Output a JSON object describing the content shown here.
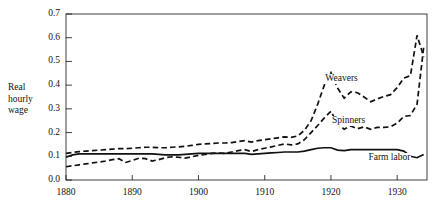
{
  "chart_data": {
    "type": "line",
    "title": "",
    "subtitle": "",
    "xlabel": "",
    "ylabel": "Real hourly wage",
    "ylabel_lines": [
      "Real",
      "hourly",
      "wage"
    ],
    "xlim": [
      1880,
      1934.5
    ],
    "ylim": [
      0.0,
      0.7
    ],
    "grid": false,
    "legend_position": "inline-annotations",
    "x_ticks": [
      1880,
      1890,
      1900,
      1910,
      1920,
      1930
    ],
    "x_tick_labels": [
      "1880",
      "1890",
      "1900",
      "1910",
      "1920",
      "1930"
    ],
    "y_ticks": [
      0.0,
      0.1,
      0.2,
      0.3,
      0.4,
      0.5,
      0.6,
      0.7
    ],
    "y_tick_labels": [
      "0.0",
      "0.1",
      "0.2",
      "0.3",
      "0.4",
      "0.5",
      "0.6",
      "0.7"
    ],
    "annotations": [
      {
        "text": "Weavers",
        "x": 1919.0,
        "y": 0.425
      },
      {
        "text": "Spinners",
        "x": 1920.0,
        "y": 0.248
      },
      {
        "text": "Farm labor",
        "x": 1925.5,
        "y": 0.092
      }
    ],
    "series": [
      {
        "name": "Weavers",
        "style": "dashed",
        "color": "#111111",
        "x": [
          1880,
          1881,
          1882,
          1883,
          1884,
          1885,
          1886,
          1887,
          1888,
          1889,
          1890,
          1891,
          1892,
          1893,
          1894,
          1895,
          1896,
          1897,
          1898,
          1899,
          1900,
          1901,
          1902,
          1903,
          1904,
          1905,
          1906,
          1907,
          1908,
          1909,
          1910,
          1911,
          1912,
          1913,
          1914,
          1915,
          1916,
          1917,
          1918,
          1919,
          1920,
          1921,
          1922,
          1923,
          1924,
          1925,
          1926,
          1927,
          1928,
          1929,
          1930,
          1931,
          1932,
          1933,
          1934
        ],
        "values": [
          0.112,
          0.116,
          0.12,
          0.122,
          0.124,
          0.126,
          0.128,
          0.13,
          0.132,
          0.132,
          0.134,
          0.136,
          0.138,
          0.138,
          0.136,
          0.136,
          0.138,
          0.14,
          0.142,
          0.146,
          0.15,
          0.152,
          0.154,
          0.156,
          0.156,
          0.158,
          0.162,
          0.166,
          0.16,
          0.166,
          0.17,
          0.174,
          0.178,
          0.182,
          0.18,
          0.186,
          0.21,
          0.25,
          0.32,
          0.4,
          0.452,
          0.388,
          0.345,
          0.372,
          0.368,
          0.35,
          0.33,
          0.342,
          0.352,
          0.36,
          0.39,
          0.43,
          0.44,
          0.61,
          0.52
        ]
      },
      {
        "name": "Spinners",
        "style": "dashed",
        "color": "#111111",
        "x": [
          1880,
          1881,
          1882,
          1883,
          1884,
          1885,
          1886,
          1887,
          1888,
          1889,
          1890,
          1891,
          1892,
          1893,
          1894,
          1895,
          1896,
          1897,
          1898,
          1899,
          1900,
          1901,
          1902,
          1903,
          1904,
          1905,
          1906,
          1907,
          1908,
          1909,
          1910,
          1911,
          1912,
          1913,
          1914,
          1915,
          1916,
          1917,
          1918,
          1919,
          1920,
          1921,
          1922,
          1923,
          1924,
          1925,
          1926,
          1927,
          1928,
          1929,
          1930,
          1931,
          1932,
          1933,
          1934
        ],
        "values": [
          0.056,
          0.06,
          0.064,
          0.068,
          0.072,
          0.076,
          0.08,
          0.086,
          0.09,
          0.074,
          0.082,
          0.092,
          0.09,
          0.08,
          0.086,
          0.094,
          0.098,
          0.096,
          0.092,
          0.098,
          0.104,
          0.108,
          0.112,
          0.114,
          0.112,
          0.118,
          0.124,
          0.128,
          0.12,
          0.128,
          0.134,
          0.14,
          0.146,
          0.152,
          0.148,
          0.152,
          0.17,
          0.2,
          0.23,
          0.262,
          0.29,
          0.236,
          0.214,
          0.228,
          0.216,
          0.224,
          0.214,
          0.222,
          0.222,
          0.224,
          0.24,
          0.268,
          0.272,
          0.32,
          0.56
        ]
      },
      {
        "name": "Farm labor",
        "style": "solid",
        "color": "#111111",
        "x": [
          1880,
          1881,
          1882,
          1883,
          1884,
          1885,
          1886,
          1887,
          1888,
          1889,
          1890,
          1891,
          1892,
          1893,
          1894,
          1895,
          1896,
          1897,
          1898,
          1899,
          1900,
          1901,
          1902,
          1903,
          1904,
          1905,
          1906,
          1907,
          1908,
          1909,
          1910,
          1911,
          1912,
          1913,
          1914,
          1915,
          1916,
          1917,
          1918,
          1919,
          1920,
          1921,
          1922,
          1923,
          1924,
          1925,
          1926,
          1927,
          1928,
          1929,
          1930,
          1931,
          1932,
          1933,
          1934
        ],
        "values": [
          0.096,
          0.106,
          0.11,
          0.11,
          0.11,
          0.11,
          0.11,
          0.11,
          0.11,
          0.11,
          0.11,
          0.11,
          0.11,
          0.11,
          0.108,
          0.106,
          0.106,
          0.106,
          0.108,
          0.11,
          0.112,
          0.112,
          0.112,
          0.112,
          0.112,
          0.112,
          0.112,
          0.112,
          0.108,
          0.11,
          0.112,
          0.114,
          0.116,
          0.118,
          0.118,
          0.118,
          0.122,
          0.128,
          0.134,
          0.136,
          0.136,
          0.126,
          0.124,
          0.128,
          0.128,
          0.128,
          0.128,
          0.128,
          0.128,
          0.128,
          0.128,
          0.122,
          0.1,
          0.094,
          0.108
        ]
      }
    ]
  }
}
